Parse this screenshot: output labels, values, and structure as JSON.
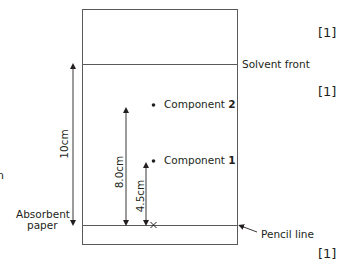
{
  "diagram": {
    "labels": {
      "solvent_front": "Solvent front",
      "pencil_line": "Pencil line",
      "absorbent_paper_line1": "Absorbent",
      "absorbent_paper_line2": "paper",
      "component_2_prefix": "Component ",
      "component_2_num": "2",
      "component_1_prefix": "Component ",
      "component_1_num": "1",
      "origin_mark": "×"
    },
    "measurements": {
      "solvent_distance": "10cm",
      "component_2_distance": "8.0cm",
      "component_1_distance": "4.5cm"
    },
    "marks": [
      "[1]",
      "[1]",
      "[1]"
    ],
    "edge_fragment": "n",
    "colors": {
      "line": "#5a5a5a",
      "text": "#231f20"
    }
  }
}
